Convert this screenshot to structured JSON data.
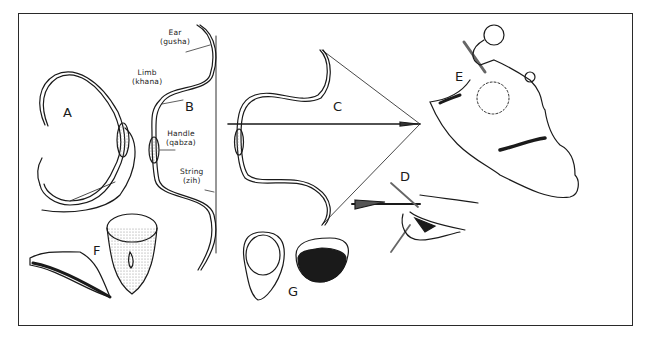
{
  "figure": {
    "panels": [
      {
        "id": "A",
        "label": "A",
        "description": "unstrung composite bow (reflexed)"
      },
      {
        "id": "B",
        "label": "B",
        "description": "braced composite bow with labeled parts"
      },
      {
        "id": "C",
        "label": "C",
        "description": "bow at full draw with arrow"
      },
      {
        "id": "D",
        "label": "D",
        "description": "thumb-ring draw (hand with arrow)"
      },
      {
        "id": "E",
        "label": "E",
        "description": "broken archer's thumb ring / fragment"
      },
      {
        "id": "F",
        "label": "F",
        "description": "thumb ring, side and front views"
      },
      {
        "id": "G",
        "label": "G",
        "description": "thumb ring, top and side views"
      }
    ],
    "part_labels": {
      "ear": {
        "name": "Ear",
        "term": "(gusha)"
      },
      "limb": {
        "name": "Limb",
        "term": "(khana)"
      },
      "handle": {
        "name": "Handle",
        "term": "(qabza)"
      },
      "string": {
        "name": "String",
        "term": "(zih)"
      }
    },
    "colors": {
      "ink": "#1a1a1a",
      "paper": "#ffffff",
      "stipple": "#9a9a9a"
    }
  }
}
